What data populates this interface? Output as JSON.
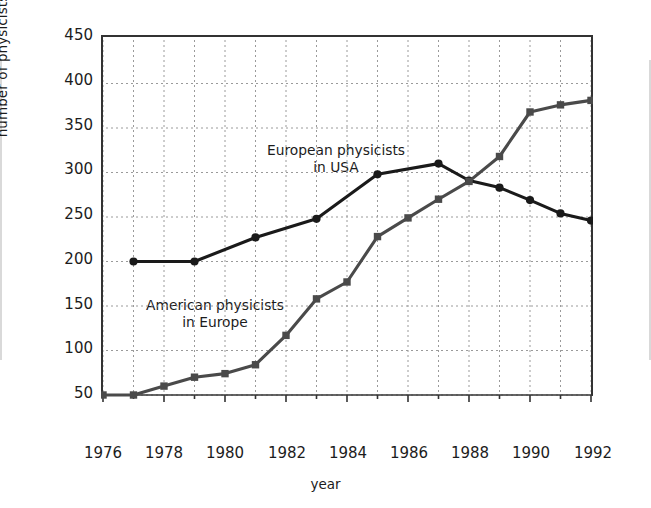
{
  "chart_data": {
    "type": "line",
    "title": "",
    "xlabel": "year",
    "ylabel": "number of physicists",
    "xlim": [
      1976,
      1992
    ],
    "ylim": [
      50,
      450
    ],
    "xticks": [
      1976,
      1978,
      1980,
      1982,
      1984,
      1986,
      1988,
      1990,
      1992
    ],
    "yticks": [
      50,
      100,
      150,
      200,
      250,
      300,
      350,
      400,
      450
    ],
    "grid": true,
    "legend_position": "inline-annotations",
    "series": [
      {
        "name": "European physicists in USA",
        "color": "#1a1a1a",
        "marker": "circle",
        "annotation": "European physicists\nin USA",
        "points": [
          {
            "x": 1977,
            "y": 200
          },
          {
            "x": 1979,
            "y": 200
          },
          {
            "x": 1981,
            "y": 227
          },
          {
            "x": 1983,
            "y": 248
          },
          {
            "x": 1985,
            "y": 298
          },
          {
            "x": 1987,
            "y": 310
          },
          {
            "x": 1988,
            "y": 291
          },
          {
            "x": 1989,
            "y": 283
          },
          {
            "x": 1990,
            "y": 269
          },
          {
            "x": 1991,
            "y": 254
          },
          {
            "x": 1992,
            "y": 246
          }
        ]
      },
      {
        "name": "American physicists in Europe",
        "color": "#4a4a4a",
        "marker": "square",
        "annotation": "American physicists\nin Europe",
        "points": [
          {
            "x": 1976,
            "y": 50
          },
          {
            "x": 1977,
            "y": 50
          },
          {
            "x": 1978,
            "y": 60
          },
          {
            "x": 1979,
            "y": 70
          },
          {
            "x": 1980,
            "y": 74
          },
          {
            "x": 1981,
            "y": 84
          },
          {
            "x": 1982,
            "y": 117
          },
          {
            "x": 1983,
            "y": 158
          },
          {
            "x": 1984,
            "y": 177
          },
          {
            "x": 1985,
            "y": 228
          },
          {
            "x": 1986,
            "y": 249
          },
          {
            "x": 1987,
            "y": 270
          },
          {
            "x": 1988,
            "y": 290
          },
          {
            "x": 1989,
            "y": 318
          },
          {
            "x": 1990,
            "y": 368
          },
          {
            "x": 1991,
            "y": 376
          },
          {
            "x": 1992,
            "y": 381
          }
        ]
      }
    ]
  },
  "axes": {
    "ytick_labels": [
      "450",
      "400",
      "350",
      "300",
      "250",
      "200",
      "150",
      "100",
      "50"
    ],
    "xtick_labels": [
      "1976",
      "1978",
      "1980",
      "1982",
      "1984",
      "1986",
      "1988",
      "1990",
      "1992"
    ],
    "ylabel": "number of physicists",
    "xlabel": "year"
  },
  "annotations": {
    "upper_line1": "European physicists",
    "upper_line2": "in USA",
    "lower_line1": "American physicists",
    "lower_line2": "in Europe"
  },
  "colors": {
    "upper_series": "#1a1a1a",
    "lower_series": "#4a4a4a",
    "grid": "#9a9a9a",
    "axis": "#333333",
    "background": "#ffffff"
  }
}
